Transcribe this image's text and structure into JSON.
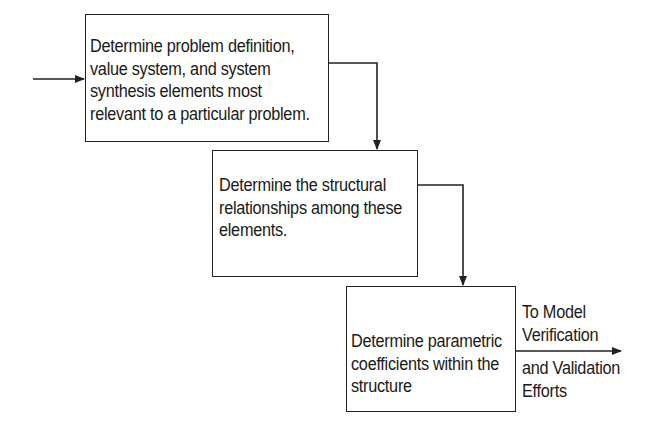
{
  "diagram": {
    "type": "process-flow",
    "steps": [
      {
        "id": "step-1",
        "lines": [
          "Determine problem definition,",
          "value system, and system",
          "synthesis elements most",
          "relevant to a particular problem."
        ]
      },
      {
        "id": "step-2",
        "lines": [
          "Determine the structural",
          "relationships among these",
          "elements."
        ]
      },
      {
        "id": "step-3",
        "lines": [
          "Determine parametric",
          "coefficients within the",
          "structure"
        ]
      }
    ],
    "output_label": {
      "lines": [
        "To Model",
        "Verification",
        "and Validation",
        "Efforts"
      ]
    },
    "colors": {
      "stroke": "#222222",
      "text": "#1a1a1a",
      "background": "#ffffff"
    }
  }
}
